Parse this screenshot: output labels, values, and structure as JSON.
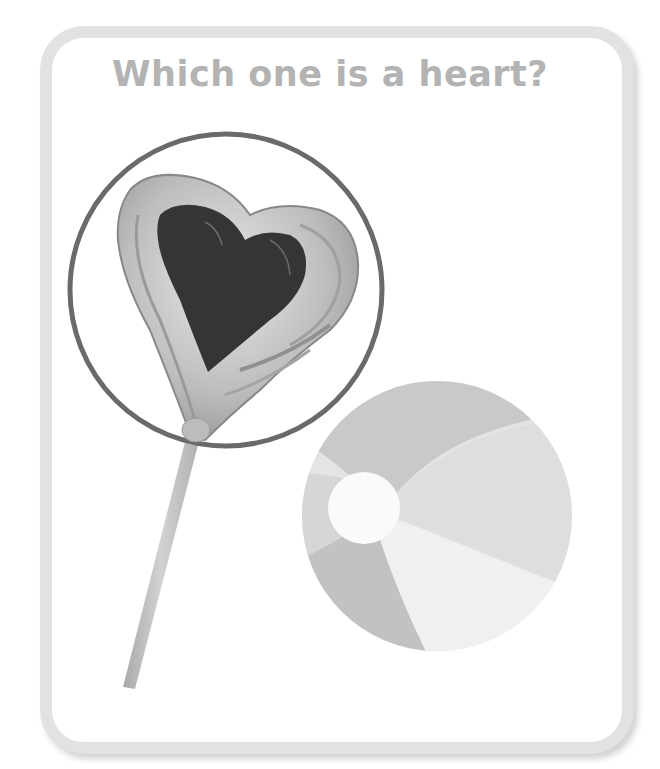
{
  "question": {
    "title": "Which one is a heart?"
  },
  "options": [
    {
      "id": "lollipop",
      "label": "heart-shaped lollipop",
      "selected": true
    },
    {
      "id": "beach-ball",
      "label": "beach ball",
      "selected": false
    }
  ],
  "colors": {
    "card_border": "#e2e2e2",
    "title_text": "#b3b3b3",
    "selection_ring": "#6a6a6a",
    "heart_chocolate": "#353535",
    "stick": "#c4c4c4"
  }
}
